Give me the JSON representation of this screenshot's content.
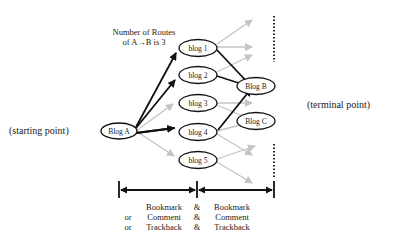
{
  "title_lines": [
    "Number of Routes",
    "of  A→B is 3"
  ],
  "start_label": "(starting point)",
  "terminal_label": "(terminal point)",
  "nodes": {
    "blog_a": "Blog A",
    "blog_1": "blog 1",
    "blog_2": "blog 2",
    "blog_3": "blog 3",
    "blog_4": "blog 4",
    "blog_5": "blog 5",
    "blog_b": "Blog B",
    "blog_c": "Blog C"
  },
  "legend": {
    "rows": [
      {
        "prefix": "",
        "left": "Bookmark",
        "joiner": "&",
        "right": "Bookmark"
      },
      {
        "prefix": "or",
        "left": "Comment",
        "joiner": "&",
        "right": "Comment"
      },
      {
        "prefix": "or",
        "left": "Trackback",
        "joiner": "&",
        "right": "Trackback"
      }
    ]
  },
  "colors": {
    "highlight_edge": "#111111",
    "other_edge": "#c4c4c4",
    "node_stroke": "#111111"
  }
}
